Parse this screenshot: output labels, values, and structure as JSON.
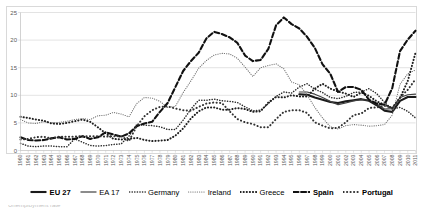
{
  "chart_data": {
    "type": "line",
    "title": "",
    "xlabel": "",
    "ylabel": "",
    "ylim": [
      0,
      25
    ],
    "yticks": [
      0,
      5,
      10,
      15,
      20,
      25
    ],
    "grid": true,
    "legend_position": "bottom",
    "x": [
      1960,
      1961,
      1962,
      1963,
      1964,
      1965,
      1966,
      1967,
      1968,
      1969,
      1970,
      1971,
      1972,
      1973,
      1974,
      1975,
      1976,
      1977,
      1978,
      1979,
      1980,
      1981,
      1982,
      1983,
      1984,
      1985,
      1986,
      1987,
      1988,
      1989,
      1990,
      1991,
      1992,
      1993,
      1994,
      1995,
      1996,
      1997,
      1998,
      1999,
      2000,
      2001,
      2002,
      2003,
      2004,
      2005,
      2006,
      2007,
      2008,
      2009,
      2010,
      2011
    ],
    "series": [
      {
        "name": "EU 27",
        "style": "solid-bold",
        "color": "#1a1a1a",
        "values": [
          null,
          null,
          null,
          null,
          null,
          null,
          null,
          null,
          null,
          null,
          null,
          null,
          null,
          null,
          null,
          null,
          null,
          null,
          null,
          null,
          null,
          null,
          null,
          null,
          null,
          null,
          null,
          null,
          null,
          null,
          null,
          null,
          null,
          null,
          null,
          null,
          10.2,
          10.1,
          9.6,
          9.2,
          8.8,
          8.6,
          8.9,
          9.1,
          9.3,
          9.0,
          8.2,
          7.2,
          7.0,
          9.0,
          9.7,
          9.7
        ]
      },
      {
        "name": "EA 17",
        "style": "solid-thin",
        "color": "#404040",
        "values": [
          null,
          null,
          null,
          null,
          null,
          null,
          null,
          null,
          null,
          null,
          null,
          null,
          null,
          null,
          null,
          null,
          null,
          null,
          null,
          null,
          null,
          null,
          null,
          null,
          null,
          null,
          null,
          null,
          null,
          null,
          null,
          null,
          null,
          null,
          null,
          null,
          10.6,
          10.6,
          10.2,
          9.6,
          8.9,
          8.3,
          8.6,
          9.0,
          9.2,
          9.1,
          8.4,
          7.5,
          7.6,
          9.6,
          10.1,
          10.2
        ]
      },
      {
        "name": "Germany",
        "style": "dotted-med",
        "color": "#2b2b2b",
        "values": [
          1.3,
          0.8,
          0.7,
          0.8,
          0.8,
          0.7,
          0.7,
          2.1,
          1.5,
          0.9,
          0.8,
          0.9,
          1.1,
          1.2,
          2.6,
          4.7,
          4.6,
          4.5,
          4.3,
          3.8,
          3.8,
          5.5,
          7.5,
          9.1,
          9.1,
          9.3,
          9.0,
          8.9,
          8.7,
          7.9,
          7.2,
          7.3,
          8.5,
          9.8,
          10.6,
          10.4,
          11.5,
          12.1,
          11.1,
          10.5,
          9.6,
          9.4,
          9.8,
          10.5,
          10.6,
          11.2,
          10.3,
          8.7,
          7.5,
          7.8,
          7.1,
          5.9
        ]
      },
      {
        "name": "Ireland",
        "style": "dotted-fine",
        "color": "#6e6e6e",
        "values": [
          5.6,
          5.0,
          4.9,
          5.2,
          5.0,
          5.1,
          5.3,
          5.6,
          5.8,
          5.6,
          6.3,
          6.4,
          6.9,
          6.6,
          6.1,
          8.5,
          9.6,
          9.5,
          8.9,
          7.8,
          8.0,
          10.5,
          12.6,
          14.9,
          16.3,
          17.3,
          17.6,
          17.5,
          16.7,
          15.1,
          13.4,
          15.0,
          15.4,
          15.7,
          14.8,
          12.4,
          11.9,
          10.1,
          7.8,
          5.9,
          4.3,
          3.9,
          4.5,
          4.7,
          4.6,
          4.4,
          4.5,
          4.7,
          6.4,
          12.0,
          13.9,
          14.6
        ]
      },
      {
        "name": "Greece",
        "style": "dotted-bold",
        "color": "#1f1f1f",
        "values": [
          6.1,
          5.9,
          5.6,
          5.4,
          4.9,
          4.8,
          5.0,
          5.3,
          5.6,
          5.2,
          4.2,
          3.1,
          2.1,
          2.0,
          2.1,
          2.3,
          1.9,
          1.7,
          1.8,
          1.9,
          2.7,
          4.0,
          5.8,
          7.1,
          7.8,
          7.8,
          7.4,
          7.4,
          7.7,
          7.5,
          7.0,
          7.1,
          8.7,
          9.7,
          9.6,
          10.0,
          9.8,
          9.8,
          11.2,
          12.1,
          11.2,
          10.7,
          10.3,
          9.7,
          10.5,
          9.9,
          8.9,
          8.3,
          7.7,
          9.5,
          12.6,
          17.7
        ]
      },
      {
        "name": "Spain",
        "style": "dashed-bold",
        "color": "#111111",
        "values": [
          2.4,
          1.9,
          1.8,
          1.9,
          2.2,
          2.4,
          2.0,
          2.1,
          2.6,
          2.1,
          2.4,
          3.3,
          2.9,
          2.5,
          3.1,
          4.4,
          4.9,
          5.2,
          7.0,
          8.6,
          11.5,
          14.4,
          16.2,
          17.7,
          20.3,
          21.5,
          21.1,
          20.5,
          19.5,
          17.2,
          16.2,
          16.4,
          18.4,
          22.7,
          24.1,
          22.9,
          22.1,
          20.6,
          18.6,
          15.6,
          13.9,
          10.6,
          11.5,
          11.5,
          11.0,
          9.2,
          8.5,
          8.3,
          11.3,
          18.0,
          20.1,
          21.7
        ]
      },
      {
        "name": "Portugal",
        "style": "dotted-heavy",
        "color": "#333333",
        "values": [
          2.0,
          2.1,
          2.4,
          2.5,
          2.2,
          2.5,
          2.5,
          2.5,
          2.6,
          2.6,
          2.6,
          2.5,
          2.6,
          2.6,
          1.7,
          4.4,
          6.2,
          7.3,
          7.9,
          8.0,
          7.6,
          7.3,
          7.2,
          7.9,
          8.5,
          8.7,
          8.6,
          7.1,
          5.7,
          5.1,
          4.8,
          4.2,
          4.2,
          5.7,
          7.0,
          7.3,
          7.3,
          6.8,
          5.1,
          4.5,
          4.0,
          4.1,
          5.1,
          6.4,
          6.7,
          7.7,
          7.8,
          8.1,
          7.7,
          9.6,
          11.0,
          12.9
        ]
      }
    ]
  },
  "legend": {
    "items": [
      {
        "label": "EU 27",
        "bold": true
      },
      {
        "label": "EA 17",
        "bold": false
      },
      {
        "label": "Germany",
        "bold": false
      },
      {
        "label": "Ireland",
        "bold": false
      },
      {
        "label": "Greece",
        "bold": false
      },
      {
        "label": "Spain",
        "bold": true
      },
      {
        "label": "Portugal",
        "bold": true
      }
    ]
  },
  "bottom_sliver": {
    "text": "Unemployment rate"
  }
}
